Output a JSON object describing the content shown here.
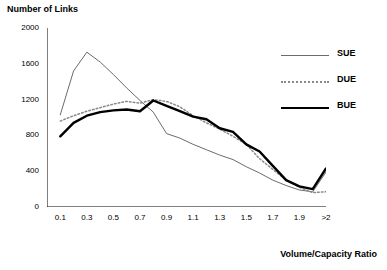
{
  "chart_data": {
    "type": "line",
    "title": "Number of Links",
    "xlabel": "Volume/Capacity Ratio",
    "ylabel": "Number of Links",
    "xlim": [
      0.0,
      2.1
    ],
    "ylim": [
      0,
      2000
    ],
    "grid": false,
    "legend_position": "right",
    "x": [
      0.1,
      0.2,
      0.3,
      0.4,
      0.5,
      0.6,
      0.7,
      0.8,
      0.9,
      1.0,
      1.1,
      1.2,
      1.3,
      1.4,
      1.5,
      1.6,
      1.7,
      1.8,
      1.9,
      2.0,
      2.1
    ],
    "xtick_labels": [
      "0.1",
      "0.3",
      "0.5",
      "0.7",
      "0.9",
      "1.1",
      "1.3",
      "1.5",
      "1.7",
      "1.9",
      ">2"
    ],
    "xtick_values": [
      0.1,
      0.3,
      0.5,
      0.7,
      0.9,
      1.1,
      1.3,
      1.5,
      1.7,
      1.9,
      2.1
    ],
    "ytick_labels": [
      "0",
      "400",
      "800",
      "1200",
      "1600",
      "2000"
    ],
    "ytick_values": [
      0,
      400,
      800,
      1200,
      1600,
      2000
    ],
    "series": [
      {
        "name": "SUE",
        "color": "#6b6b6b",
        "style": "solid",
        "width": 1,
        "values": [
          1030,
          1520,
          1730,
          1620,
          1480,
          1330,
          1190,
          1060,
          820,
          770,
          700,
          640,
          580,
          530,
          450,
          380,
          300,
          240,
          190,
          170,
          390
        ]
      },
      {
        "name": "DUE",
        "color": "#8a8a8a",
        "style": "dotted",
        "width": 1.5,
        "values": [
          960,
          1020,
          1070,
          1110,
          1150,
          1180,
          1160,
          1200,
          1180,
          1120,
          1020,
          940,
          870,
          790,
          700,
          540,
          420,
          300,
          220,
          160,
          170
        ]
      },
      {
        "name": "BUE",
        "color": "#000000",
        "style": "solid",
        "width": 2.4,
        "values": [
          790,
          940,
          1020,
          1060,
          1080,
          1090,
          1070,
          1190,
          1130,
          1070,
          1010,
          980,
          880,
          840,
          700,
          620,
          460,
          300,
          230,
          200,
          430
        ]
      }
    ]
  }
}
